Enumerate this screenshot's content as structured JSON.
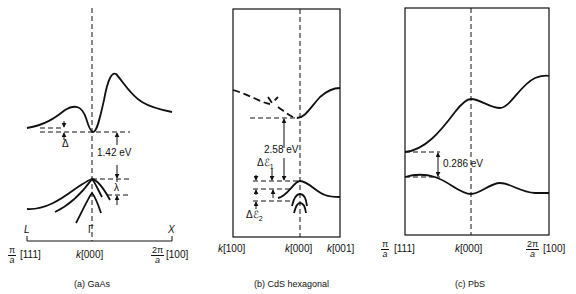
{
  "panels": [
    {
      "id": "a",
      "caption": "(a)  GaAs",
      "material": "GaAs",
      "left_label": {
        "num": "π",
        "den": "a",
        "dir": "[111]"
      },
      "center_label": {
        "k": "k",
        "dir": "[000]"
      },
      "right_label": {
        "num": "2π",
        "den": "a",
        "dir": "[100]"
      },
      "point_labels": {
        "left": "L",
        "center": "Γ",
        "right": "X"
      },
      "annotations": {
        "gap": "1.42 eV",
        "delta": "Δ",
        "lambda": "λ"
      }
    },
    {
      "id": "b",
      "caption": "(b)  CdS hexagonal",
      "material": "CdS hexagonal",
      "left_label": {
        "k": "k",
        "dir": "[100]"
      },
      "center_label": {
        "k": "k",
        "dir": "[000]"
      },
      "right_label": {
        "k": "k",
        "dir": "[001]"
      },
      "annotations": {
        "gap": "2.58 eV",
        "delta1": "Δℰ",
        "delta1_sub": "1",
        "delta2": "Δℰ",
        "delta2_sub": "2"
      }
    },
    {
      "id": "c",
      "caption": "(c)  PbS",
      "material": "PbS",
      "left_label": {
        "num": "π",
        "den": "a",
        "dir": "[111]"
      },
      "center_label": {
        "k": "k",
        "dir": "[000]"
      },
      "right_label": {
        "num": "2π",
        "den": "a",
        "dir": "[100]"
      },
      "annotations": {
        "gap": "0.286 eV"
      }
    }
  ]
}
